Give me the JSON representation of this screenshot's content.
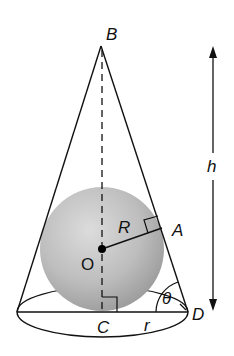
{
  "diagram": {
    "title": "",
    "type": "sphere inscribed in cone",
    "labels": {
      "apex": "B",
      "tangent_point": "A",
      "center": "O",
      "base_center": "C",
      "base_edge": "D",
      "sphere_radius": "R",
      "cone_radius": "r",
      "height": "h",
      "angle": "θ"
    },
    "colors": {
      "line": "#111111",
      "sphere_light": "#d9d9d9",
      "sphere_dark": "#9a9a9a",
      "background": "#ffffff"
    }
  }
}
